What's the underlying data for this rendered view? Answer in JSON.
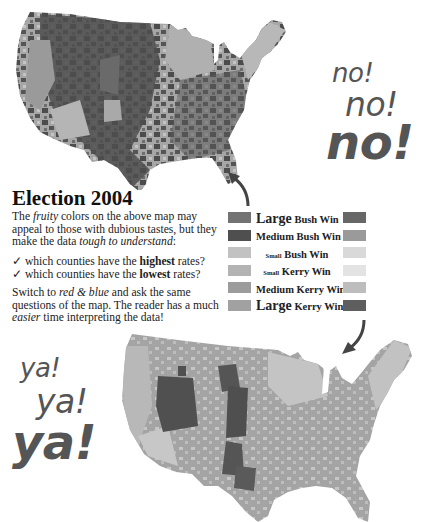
{
  "top_map": {
    "alt": "US county map of 2004 election in fruity colors (rendered in grayscale)",
    "colors": {
      "base": "#a8a8a8",
      "dark": "#4a4a4a",
      "mid": "#6e6e6e",
      "light": "#c4c4c4"
    }
  },
  "no_text": [
    "no!",
    "no!",
    "no!"
  ],
  "title": "Election 2004",
  "intro": {
    "part1": "The ",
    "fruity": "fruity",
    "part2": " colors on the above map may appeal to those with dubious tastes, but they make the data ",
    "tough": "tough to understand",
    "part3": ":"
  },
  "questions": [
    {
      "check": "✓",
      "pre": "which counties have the ",
      "bold": "highest",
      "post": " rates?"
    },
    {
      "check": "✓",
      "pre": "which counties have the ",
      "bold": "lowest",
      "post": " rates?"
    }
  ],
  "switch_text": {
    "part1": "Switch to ",
    "rb": "red & blue",
    "part2": " and ask the same questions of the map.  The reader has a much ",
    "easier": "easier",
    "part3": " time interpreting the data!"
  },
  "legend": [
    {
      "size_word": "Large",
      "rest": " Bush Win",
      "size_class": "big",
      "left_color": "#737373",
      "right_color": "#676767"
    },
    {
      "size_word": "Medium",
      "rest": " Bush Win",
      "size_class": "med",
      "left_color": "#4f4f4f",
      "right_color": "#9a9a9a"
    },
    {
      "size_word": "Small",
      "rest": " Bush Win",
      "size_class": "sm",
      "left_color": "#c2c2c2",
      "right_color": "#d9d9d9"
    },
    {
      "size_word": "Small",
      "rest": " Kerry Win",
      "size_class": "sm",
      "left_color": "#b3b3b3",
      "right_color": "#e3e3e3"
    },
    {
      "size_word": "Medium",
      "rest": " Kerry Win",
      "size_class": "med",
      "left_color": "#9c9c9c",
      "right_color": "#bdbdbd"
    },
    {
      "size_word": "Large",
      "rest": " Kerry Win",
      "size_class": "big",
      "left_color": "#a1a1a1",
      "right_color": "#5e5e5e"
    }
  ],
  "ya_text": [
    "ya!",
    "ya!",
    "ya!"
  ],
  "bottom_map": {
    "alt": "US county map of 2004 election in red and blue (rendered in grayscale)",
    "colors": {
      "base": "#a3a3a3",
      "dark": "#4e4e4e",
      "light": "#c9c9c9"
    }
  }
}
